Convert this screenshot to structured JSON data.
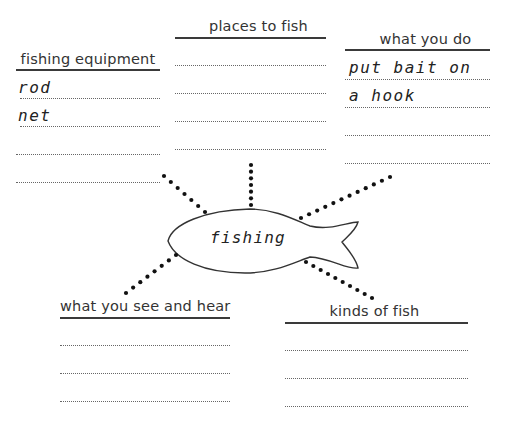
{
  "center": {
    "label": "fishing"
  },
  "boxes": {
    "equipment": {
      "title": "fishing equipment",
      "answers": [
        "rod",
        "net",
        "",
        ""
      ]
    },
    "places": {
      "title": "places to fish",
      "answers": [
        "",
        "",
        "",
        ""
      ]
    },
    "do": {
      "title": "what you do",
      "answers": [
        "put bait on",
        "a hook",
        "",
        ""
      ]
    },
    "see_hear": {
      "title": "what you see and hear",
      "answers": [
        "",
        "",
        ""
      ]
    },
    "kinds": {
      "title": "kinds of fish",
      "answers": [
        "",
        "",
        ""
      ]
    }
  }
}
